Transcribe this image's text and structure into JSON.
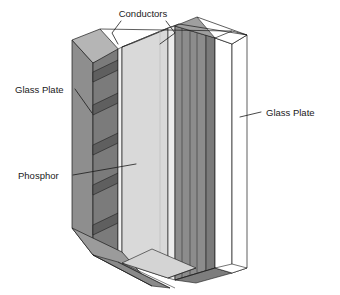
{
  "figure": {
    "type": "technical-isometric-diagram",
    "background_color": "#ffffff"
  },
  "labels": [
    {
      "id": "conductors",
      "text": "Conductors",
      "x": 143,
      "y": 17,
      "anchor": "middle",
      "leaders": [
        {
          "points": "121,21 112,33 118,44"
        },
        {
          "points": "166,21 175,33 160,44"
        }
      ]
    },
    {
      "id": "glass-plate-left",
      "text": "Glass Plate",
      "x": 15,
      "y": 93,
      "anchor": "start",
      "leaders": [
        {
          "points": "75,89 92,113"
        }
      ]
    },
    {
      "id": "glass-plate-right",
      "text": "Glass Plate",
      "x": 266,
      "y": 116,
      "anchor": "start",
      "leaders": [
        {
          "points": "261,112 240,117"
        }
      ]
    },
    {
      "id": "phosphor",
      "text": "Phosphor",
      "x": 18,
      "y": 179,
      "anchor": "start",
      "leaders": [
        {
          "points": "73,175 136,164"
        }
      ]
    }
  ],
  "materials": {
    "glass_plate_left_face": "#8e8e8e",
    "glass_plate_left_edge": "#9a9a9a",
    "conductor_dark": "#6f6f6f",
    "conductor_mid": "#848484",
    "phosphor_light": "#d9d9d9",
    "phosphor_edge": "#c9c9c9",
    "gap_white": "#ffffff",
    "right_slab": "#8c8c8c",
    "right_slab_dark": "#787878",
    "base_light": "#d4d4d4",
    "base_mid": "#9b9b9b",
    "base_dark": "#7d7d7d",
    "outline": "#1a1a1a"
  },
  "structure": {
    "description": "Layered cutaway: left glass plate, horizontal conductor strips, phosphor layer, vertical conductor strips, right transparent glass plate",
    "layer_names": [
      "Glass Plate",
      "Conductors",
      "Phosphor",
      "Conductors",
      "Glass Plate"
    ]
  }
}
